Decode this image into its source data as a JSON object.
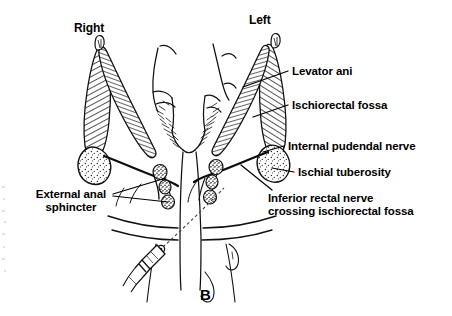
{
  "figure": {
    "panel_letter": "B",
    "background_color": "#ffffff",
    "ink_color": "#000000",
    "type": "anatomical line drawing"
  },
  "orientation_labels": [
    {
      "id": "right",
      "text": "Right",
      "x": 74,
      "y": 22
    },
    {
      "id": "left",
      "text": "Left",
      "x": 249,
      "y": 14
    }
  ],
  "callouts": [
    {
      "id": "levator-ani",
      "text": "Levator ani",
      "x": 292,
      "y": 65,
      "leader": {
        "x1": 288,
        "y1": 71,
        "x2": 243,
        "y2": 87
      }
    },
    {
      "id": "ischiorectal-fossa",
      "text": "Ischiorectal fossa",
      "x": 292,
      "y": 99,
      "leader": {
        "x1": 288,
        "y1": 105,
        "x2": 253,
        "y2": 117
      }
    },
    {
      "id": "internal-pudendal-nerve",
      "text": "Internal pudendal nerve",
      "x": 288,
      "y": 140,
      "leader": {
        "x1": 284,
        "y1": 146,
        "x2": 263,
        "y2": 152
      }
    },
    {
      "id": "ischial-tuberosity",
      "text": "Ischial tuberosity",
      "x": 298,
      "y": 166,
      "leader": {
        "x1": 294,
        "y1": 172,
        "x2": 272,
        "y2": 168
      }
    },
    {
      "id": "inferior-rectal-nerve",
      "text": "Inferior rectal nerve\ncrossing ischiorectal fossa",
      "x": 268,
      "y": 192,
      "leader": {
        "x1": 272,
        "y1": 190,
        "x2": 241,
        "y2": 165
      }
    },
    {
      "id": "external-anal-sphincter",
      "text": "External anal\nsphincter",
      "x": 29,
      "y": 188,
      "leader_a": {
        "x1": 113,
        "y1": 194,
        "x2": 166,
        "y2": 178
      },
      "leader_b": {
        "x1": 113,
        "y1": 196,
        "x2": 168,
        "y2": 202
      }
    }
  ],
  "structures": {
    "right_side_label": "Right",
    "left_side_label": "Left",
    "muscle_bands": "hatched elongated levator ani and ischiorectal fossa bands",
    "tuberosity": "stippled oval ischial tuberosity",
    "sphincter_nodules": "dark stippled external anal sphincter bundles",
    "needle": "syringe and needle entering from lower left"
  }
}
